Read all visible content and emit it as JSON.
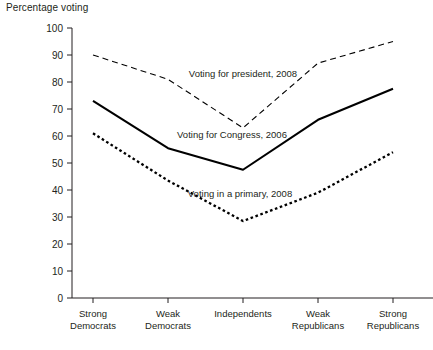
{
  "chart_data": {
    "type": "line",
    "title": "Percentage voting",
    "xlabel": "",
    "ylabel": "Percentage voting",
    "ylim": [
      0,
      100
    ],
    "ytick_values": [
      0,
      10,
      20,
      30,
      40,
      50,
      60,
      70,
      80,
      90,
      100
    ],
    "ytick_labels": [
      "0",
      "10",
      "20",
      "30",
      "40",
      "50",
      "60",
      "70",
      "80",
      "90",
      "100"
    ],
    "grid": false,
    "legend_position": "inline-annotations",
    "categories": [
      "Strong\nDemocrats",
      "Weak\nDemocrats",
      "Independents",
      "Weak\nRepublicans",
      "Strong\nRepublicans"
    ],
    "category_lines": [
      [
        "Strong",
        "Democrats"
      ],
      [
        "Weak",
        "Democrats"
      ],
      [
        "Independents"
      ],
      [
        "Weak",
        "Republicans"
      ],
      [
        "Strong",
        "Republicans"
      ]
    ],
    "series": [
      {
        "name": "Voting for president, 2008",
        "style": "dashed",
        "color": "#000000",
        "values": [
          90,
          81,
          63,
          87,
          95
        ],
        "label_x": 243,
        "label_y": 77
      },
      {
        "name": "Voting for Congress, 2006",
        "style": "solid",
        "color": "#000000",
        "values": [
          73,
          55.5,
          47.5,
          66,
          77.5
        ],
        "label_x": 232,
        "label_y": 138
      },
      {
        "name": "Voting in a primary, 2008",
        "style": "dotted",
        "color": "#000000",
        "values": [
          61,
          43.5,
          28.5,
          39,
          54
        ],
        "label_x": 240,
        "label_y": 197
      }
    ]
  },
  "axes": {
    "plot_left": 93,
    "plot_right": 393,
    "plot_top": 28,
    "plot_bottom": 298,
    "y_axis_x": 72,
    "x_tick_positions": [
      93,
      168,
      243,
      318,
      393
    ]
  }
}
